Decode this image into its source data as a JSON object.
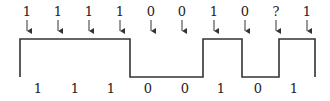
{
  "diagram": {
    "title": "",
    "top_labels": [
      "1",
      "1",
      "1",
      "1",
      "0",
      "0",
      "1",
      "0",
      "?",
      "1"
    ],
    "bottom_labels": [
      "1",
      "1",
      "1",
      "0",
      "0",
      "1",
      "0",
      "1"
    ],
    "stroke_color": "#333333"
  }
}
